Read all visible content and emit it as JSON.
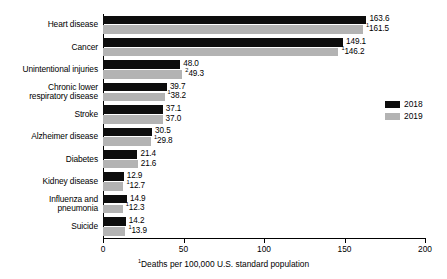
{
  "chart_data": {
    "type": "bar",
    "orientation": "horizontal",
    "title": "",
    "xlabel": "Deaths per 100,000 U.S. standard population",
    "xlabel_superscript": "1",
    "ylabel": "",
    "xlim": [
      0,
      200
    ],
    "xticks": [
      0,
      50,
      100,
      150,
      200
    ],
    "xtick_labels": [
      "0",
      "50",
      "100",
      "150",
      "200"
    ],
    "grid": false,
    "legend_position": "right",
    "categories": [
      "Heart disease",
      "Cancer",
      "Unintentional injuries",
      "Chronic lower\nrespiratory disease",
      "Stroke",
      "Alzheimer disease",
      "Diabetes",
      "Kidney disease",
      "Influenza and\npneumonia",
      "Suicide"
    ],
    "series": [
      {
        "name": "2018",
        "color": "#0d0d0d",
        "values": [
          163.6,
          149.1,
          48.0,
          39.7,
          37.1,
          30.5,
          21.4,
          12.9,
          14.9,
          14.2
        ],
        "labels": [
          "163.6",
          "149.1",
          "48.0",
          "39.7",
          "37.1",
          "30.5",
          "21.4",
          "12.9",
          "14.9",
          "14.2"
        ],
        "label_superscripts": [
          "",
          "",
          "",
          "",
          "",
          "",
          "",
          "",
          "",
          ""
        ]
      },
      {
        "name": "2019",
        "color": "#b3b3b3",
        "values": [
          161.5,
          146.2,
          49.3,
          38.2,
          37.0,
          29.8,
          21.6,
          12.7,
          12.3,
          13.9
        ],
        "labels": [
          "161.5",
          "146.2",
          "49.3",
          "38.2",
          "37.0",
          "29.8",
          "21.6",
          "12.7",
          "12.3",
          "13.9"
        ],
        "label_superscripts": [
          "1",
          "1",
          "2",
          "1",
          "",
          "1",
          "",
          "1",
          "1",
          "1"
        ]
      }
    ]
  },
  "legend": {
    "items": [
      {
        "label": "2018",
        "color": "#0d0d0d"
      },
      {
        "label": "2019",
        "color": "#b3b3b3"
      }
    ]
  }
}
